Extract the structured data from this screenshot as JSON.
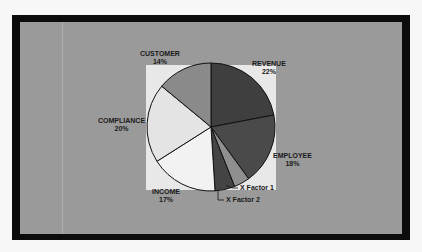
{
  "chart_data": {
    "type": "pie",
    "title": "",
    "categories": [
      "REVENUE",
      "EMPLOYEE",
      "X Factor 1",
      "X Factor 2",
      "INCOME",
      "COMPLIANCE",
      "CUSTOMER"
    ],
    "values": [
      22,
      18,
      4,
      5,
      17,
      20,
      14
    ],
    "colors": [
      "#3f3f3f",
      "#4a4a4a",
      "#8f8f8f",
      "#444444",
      "#f2f2f2",
      "#e4e4e4",
      "#8a8a8a"
    ],
    "labels": [
      {
        "name": "REVENUE",
        "pct": "22%"
      },
      {
        "name": "EMPLOYEE",
        "pct": "18%"
      },
      {
        "name": "X Factor 1",
        "pct": ""
      },
      {
        "name": "X Factor 2",
        "pct": ""
      },
      {
        "name": "INCOME",
        "pct": "17%"
      },
      {
        "name": "COMPLIANCE",
        "pct": "20%"
      },
      {
        "name": "CUSTOMER",
        "pct": "14%"
      }
    ],
    "start_angle": "12 o'clock, clockwise",
    "legend": "none (callout labels)"
  }
}
